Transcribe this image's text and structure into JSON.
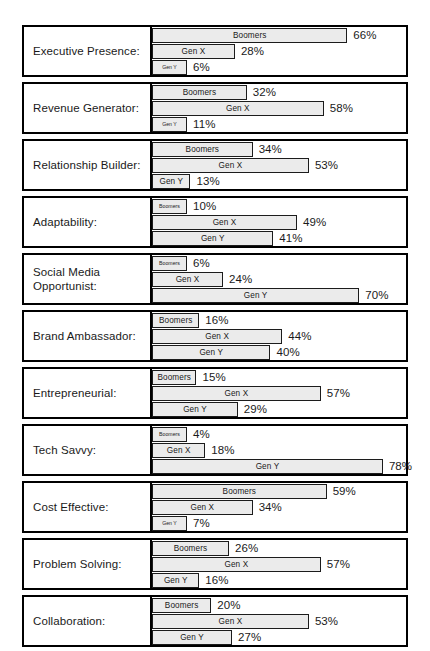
{
  "chart_data": {
    "type": "bar",
    "title": "",
    "subtitle": "",
    "xlabel": "",
    "ylabel": "",
    "orientation": "horizontal",
    "grouping": "grouped-by-category",
    "grid": false,
    "legend_position": "in-bar",
    "value_suffix": "%",
    "xlim": [
      0,
      80
    ],
    "series_names": [
      "Boomers",
      "Gen X",
      "Gen Y"
    ],
    "categories": [
      "Executive Presence:",
      "Revenue Generator:",
      "Relationship Builder:",
      "Adaptability:",
      "Social Media\nOpportunist:",
      "Brand Ambassador:",
      "Entrepreneurial:",
      "Tech Savvy:",
      "Cost Effective:",
      "Problem Solving:",
      "Collaboration:"
    ],
    "series": [
      {
        "name": "Boomers",
        "values": [
          66,
          32,
          34,
          10,
          6,
          16,
          15,
          4,
          59,
          26,
          20
        ]
      },
      {
        "name": "Gen X",
        "values": [
          28,
          58,
          53,
          49,
          24,
          44,
          57,
          18,
          34,
          57,
          53
        ]
      },
      {
        "name": "Gen Y",
        "values": [
          6,
          11,
          13,
          41,
          70,
          40,
          29,
          78,
          7,
          16,
          27
        ]
      }
    ],
    "groups": [
      {
        "category": "Executive Presence:",
        "bars": [
          {
            "series": "Boomers",
            "value": 66,
            "value_label": "66%"
          },
          {
            "series": "Gen X",
            "value": 28,
            "value_label": "28%"
          },
          {
            "series": "Gen Y",
            "value": 6,
            "value_label": "6%"
          }
        ]
      },
      {
        "category": "Revenue Generator:",
        "bars": [
          {
            "series": "Boomers",
            "value": 32,
            "value_label": "32%"
          },
          {
            "series": "Gen X",
            "value": 58,
            "value_label": "58%"
          },
          {
            "series": "Gen Y",
            "value": 11,
            "value_label": "11%"
          }
        ]
      },
      {
        "category": "Relationship Builder:",
        "bars": [
          {
            "series": "Boomers",
            "value": 34,
            "value_label": "34%"
          },
          {
            "series": "Gen X",
            "value": 53,
            "value_label": "53%"
          },
          {
            "series": "Gen Y",
            "value": 13,
            "value_label": "13%"
          }
        ]
      },
      {
        "category": "Adaptability:",
        "bars": [
          {
            "series": "Boomers",
            "value": 10,
            "value_label": "10%"
          },
          {
            "series": "Gen X",
            "value": 49,
            "value_label": "49%"
          },
          {
            "series": "Gen Y",
            "value": 41,
            "value_label": "41%"
          }
        ]
      },
      {
        "category": "Social Media\nOpportunist:",
        "bars": [
          {
            "series": "Boomers",
            "value": 6,
            "value_label": "6%"
          },
          {
            "series": "Gen X",
            "value": 24,
            "value_label": "24%"
          },
          {
            "series": "Gen Y",
            "value": 70,
            "value_label": "70%"
          }
        ]
      },
      {
        "category": "Brand Ambassador:",
        "bars": [
          {
            "series": "Boomers",
            "value": 16,
            "value_label": "16%"
          },
          {
            "series": "Gen X",
            "value": 44,
            "value_label": "44%"
          },
          {
            "series": "Gen Y",
            "value": 40,
            "value_label": "40%"
          }
        ]
      },
      {
        "category": "Entrepreneurial:",
        "bars": [
          {
            "series": "Boomers",
            "value": 15,
            "value_label": "15%"
          },
          {
            "series": "Gen X",
            "value": 57,
            "value_label": "57%"
          },
          {
            "series": "Gen Y",
            "value": 29,
            "value_label": "29%"
          }
        ]
      },
      {
        "category": "Tech Savvy:",
        "bars": [
          {
            "series": "Boomers",
            "value": 4,
            "value_label": "4%"
          },
          {
            "series": "Gen X",
            "value": 18,
            "value_label": "18%"
          },
          {
            "series": "Gen Y",
            "value": 78,
            "value_label": "78%"
          }
        ]
      },
      {
        "category": "Cost Effective:",
        "bars": [
          {
            "series": "Boomers",
            "value": 59,
            "value_label": "59%"
          },
          {
            "series": "Gen X",
            "value": 34,
            "value_label": "34%"
          },
          {
            "series": "Gen Y",
            "value": 7,
            "value_label": "7%"
          }
        ]
      },
      {
        "category": "Problem Solving:",
        "bars": [
          {
            "series": "Boomers",
            "value": 26,
            "value_label": "26%"
          },
          {
            "series": "Gen X",
            "value": 57,
            "value_label": "57%"
          },
          {
            "series": "Gen Y",
            "value": 16,
            "value_label": "16%"
          }
        ]
      },
      {
        "category": "Collaboration:",
        "bars": [
          {
            "series": "Boomers",
            "value": 20,
            "value_label": "20%"
          },
          {
            "series": "Gen X",
            "value": 53,
            "value_label": "53%"
          },
          {
            "series": "Gen Y",
            "value": 27,
            "value_label": "27%"
          }
        ]
      }
    ],
    "colors": {
      "bar_fill": "#ebebeb",
      "bar_border": "#1c1c1c",
      "group_border": "#000000",
      "text": "#1a1a1a",
      "background": "#ffffff"
    }
  }
}
